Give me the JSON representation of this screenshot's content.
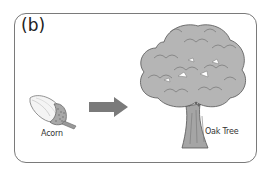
{
  "panel": {
    "label": "(b)"
  },
  "items": [
    {
      "name": "acorn",
      "caption": "Acorn"
    },
    {
      "name": "oak-tree",
      "caption": "Oak Tree"
    }
  ],
  "arrow": {
    "direction": "right",
    "color": "#777777"
  },
  "colors": {
    "frame": "#7a7a7a",
    "foliage": "#b5b5b5",
    "foliage_outline": "#555555",
    "trunk": "#999999"
  }
}
